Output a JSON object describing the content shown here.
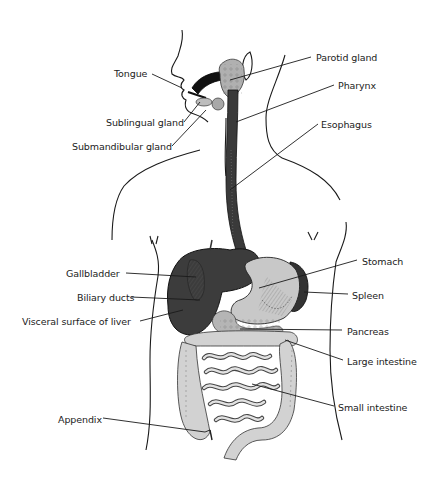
{
  "diagram": {
    "colors": {
      "ink": "#1a1a1a",
      "dark_organ": "#3a3a3a",
      "mid_organ": "#8a8a8a",
      "light_organ": "#c8c8c8",
      "background": "#ffffff"
    },
    "labels": [
      {
        "id": "tongue",
        "text": "Tongue",
        "side": "left",
        "x": 114,
        "y": 68,
        "target": [
          182,
          88
        ]
      },
      {
        "id": "sublingual",
        "text": "Sublingual gland",
        "side": "left",
        "x": 106,
        "y": 117,
        "target": [
          200,
          102
        ]
      },
      {
        "id": "submandibular",
        "text": "Submandibular gland",
        "side": "left",
        "x": 72,
        "y": 141,
        "target": [
          206,
          110
        ]
      },
      {
        "id": "parotid",
        "text": "Parotid gland",
        "side": "right",
        "x": 316,
        "y": 52,
        "target": [
          230,
          80
        ]
      },
      {
        "id": "pharynx",
        "text": "Pharynx",
        "side": "right",
        "x": 338,
        "y": 80,
        "target": [
          236,
          122
        ]
      },
      {
        "id": "esophagus",
        "text": "Esophagus",
        "side": "right",
        "x": 321,
        "y": 119,
        "target": [
          230,
          190
        ]
      },
      {
        "id": "gallbladder",
        "text": "Gallbladder",
        "side": "left",
        "x": 66,
        "y": 268,
        "target": [
          196,
          277
        ]
      },
      {
        "id": "biliary",
        "text": "Biliary ducts",
        "side": "left",
        "x": 77,
        "y": 292,
        "target": [
          200,
          300
        ]
      },
      {
        "id": "liver",
        "text": "Visceral surface of liver",
        "side": "left",
        "x": 22,
        "y": 316,
        "target": [
          183,
          310
        ]
      },
      {
        "id": "stomach",
        "text": "Stomach",
        "side": "right",
        "x": 362,
        "y": 256,
        "target": [
          259,
          288
        ]
      },
      {
        "id": "spleen",
        "text": "Spleen",
        "side": "right",
        "x": 352,
        "y": 290,
        "target": [
          304,
          292
        ]
      },
      {
        "id": "pancreas",
        "text": "Pancreas",
        "side": "right",
        "x": 347,
        "y": 326,
        "target": [
          240,
          329
        ]
      },
      {
        "id": "large_intestine",
        "text": "Large intestine",
        "side": "right",
        "x": 347,
        "y": 356,
        "target": [
          285,
          340
        ]
      },
      {
        "id": "small_intestine",
        "text": "Small intestine",
        "side": "right",
        "x": 338,
        "y": 402,
        "target": [
          252,
          384
        ]
      },
      {
        "id": "appendix",
        "text": "Appendix",
        "side": "left",
        "x": 58,
        "y": 414,
        "target": [
          210,
          430
        ]
      }
    ]
  }
}
